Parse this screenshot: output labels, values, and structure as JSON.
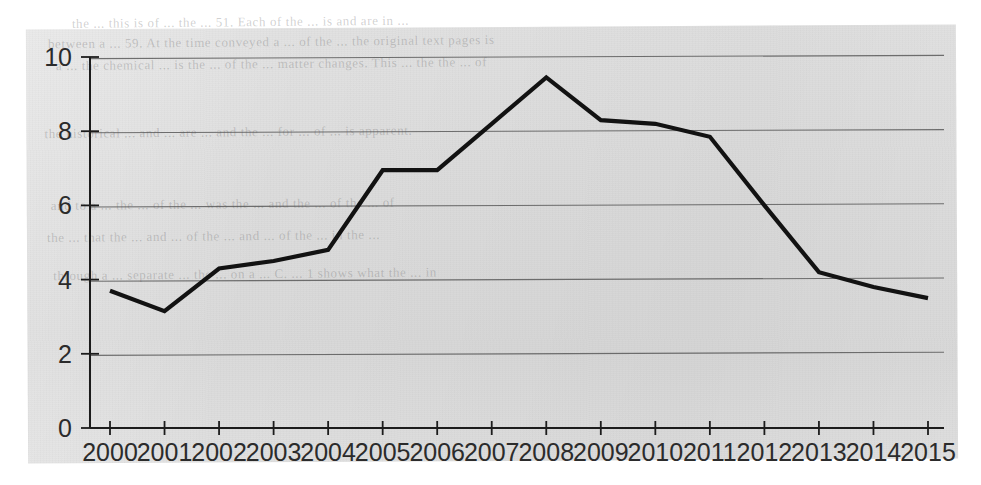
{
  "chart_data": {
    "type": "line",
    "title": "",
    "subtitle": "",
    "xlabel": "",
    "ylabel": "",
    "xlim": [
      2000,
      2015
    ],
    "ylim": [
      0,
      10
    ],
    "grid": true,
    "legend": false,
    "legend_position": "none",
    "line_color": "#121212",
    "gridline_color": "#5a5a5a",
    "background_color": "#dcdcdc",
    "y_ticks": [
      "0",
      "2",
      "4",
      "6",
      "8",
      "10"
    ],
    "y_tick_values": [
      0,
      2,
      4,
      6,
      8,
      10
    ],
    "x_ticks": [
      "2000",
      "2001",
      "2002",
      "2003",
      "2004",
      "2005",
      "2006",
      "2007",
      "2008",
      "2009",
      "2010",
      "2011",
      "2012",
      "2013",
      "2014",
      "2015"
    ],
    "categories": [
      2000,
      2001,
      2002,
      2003,
      2004,
      2005,
      2006,
      2007,
      2008,
      2009,
      2010,
      2011,
      2012,
      2013,
      2014,
      2015
    ],
    "values": [
      3.7,
      3.15,
      4.3,
      4.5,
      4.8,
      6.95,
      6.95,
      8.2,
      9.45,
      8.3,
      8.2,
      7.85,
      6.0,
      4.2,
      3.8,
      3.5
    ],
    "series": [
      {
        "name": "series-1",
        "values": [
          3.7,
          3.15,
          4.3,
          4.5,
          4.8,
          6.95,
          6.95,
          8.2,
          9.45,
          8.3,
          8.2,
          7.85,
          6.0,
          4.2,
          3.8,
          3.5
        ]
      }
    ],
    "annotations": []
  },
  "scan_artifacts": {
    "bleed_text": [
      "the ... this is of ... the ... 51. Each of the ... is and are in ...",
      "between a ... 59. At the time conveyed a ... of the ... the original text pages is",
      "a ... the chemical ... is the ... of the ... matter changes. This ... the the ... of",
      "",
      "the historical ... and ... are ... and the ... for ... of ... is apparent.",
      "",
      "and to a ... the ... of the ... was the ... and the ... of the ... of",
      "the ... that the ... and ... of the ... and ... of the ... in the ...",
      "through a ... separate ... the ... on a ... C. ... 1 shows what the ... in"
    ]
  }
}
